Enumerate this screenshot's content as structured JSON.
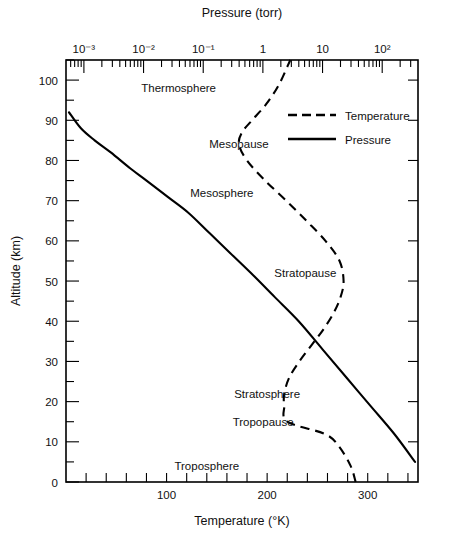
{
  "chart_data": {
    "type": "line",
    "title": "",
    "xlabel": "Temperature (°K)",
    "ylabel": "Altitude (km)",
    "top_axis_label": "Pressure (torr)",
    "grid": false,
    "legend_position": "upper-right",
    "xlim": [
      0,
      350
    ],
    "ylim": [
      0,
      105
    ],
    "top_xlim_log": [
      -3.3,
      2.6
    ],
    "x_ticks": [
      0,
      20,
      40,
      60,
      80,
      100,
      120,
      140,
      160,
      180,
      200,
      220,
      240,
      260,
      280,
      300,
      320,
      340
    ],
    "x_tick_labels": [
      "100",
      "200",
      "300"
    ],
    "x_tick_label_values": [
      100,
      200,
      300
    ],
    "y_ticks": [
      0,
      5,
      10,
      15,
      20,
      25,
      30,
      35,
      40,
      45,
      50,
      55,
      60,
      65,
      70,
      75,
      80,
      85,
      90,
      95,
      100,
      105
    ],
    "y_tick_labels": [
      "0",
      "10",
      "20",
      "30",
      "40",
      "50",
      "60",
      "70",
      "80",
      "90",
      "100"
    ],
    "y_tick_label_values": [
      0,
      10,
      20,
      30,
      40,
      50,
      60,
      70,
      80,
      90,
      100
    ],
    "top_tick_labels": [
      "10⁻³",
      "10⁻²",
      "10⁻¹",
      "1",
      "10",
      "10²"
    ],
    "top_tick_exponents": [
      -3,
      -2,
      -1,
      0,
      1,
      2
    ],
    "series": [
      {
        "name": "Temperature",
        "style": "dashed",
        "axis": "bottom",
        "units": "°K",
        "points": [
          {
            "temperature": 288,
            "altitude": 0
          },
          {
            "temperature": 283,
            "altitude": 4
          },
          {
            "temperature": 271,
            "altitude": 9
          },
          {
            "temperature": 257,
            "altitude": 12
          },
          {
            "temperature": 220,
            "altitude": 15
          },
          {
            "temperature": 217,
            "altitude": 19
          },
          {
            "temperature": 217,
            "altitude": 22
          },
          {
            "temperature": 222,
            "altitude": 26
          },
          {
            "temperature": 232,
            "altitude": 30
          },
          {
            "temperature": 244,
            "altitude": 34
          },
          {
            "temperature": 256,
            "altitude": 38
          },
          {
            "temperature": 266,
            "altitude": 42
          },
          {
            "temperature": 273,
            "altitude": 46
          },
          {
            "temperature": 276,
            "altitude": 50
          },
          {
            "temperature": 272,
            "altitude": 55
          },
          {
            "temperature": 258,
            "altitude": 60
          },
          {
            "temperature": 239,
            "altitude": 65
          },
          {
            "temperature": 219,
            "altitude": 70
          },
          {
            "temperature": 198,
            "altitude": 75
          },
          {
            "temperature": 180,
            "altitude": 80
          },
          {
            "temperature": 172,
            "altitude": 84
          },
          {
            "temperature": 175,
            "altitude": 87
          },
          {
            "temperature": 185,
            "altitude": 90
          },
          {
            "temperature": 199,
            "altitude": 94
          },
          {
            "temperature": 212,
            "altitude": 99
          },
          {
            "temperature": 223,
            "altitude": 105
          }
        ]
      },
      {
        "name": "Pressure",
        "style": "solid",
        "axis": "top",
        "units": "torr",
        "points": [
          {
            "pressure_log10": -3.25,
            "altitude": 92
          },
          {
            "pressure_log10": -3.05,
            "altitude": 88
          },
          {
            "pressure_log10": -2.82,
            "altitude": 85
          },
          {
            "pressure_log10": -2.55,
            "altitude": 82
          },
          {
            "pressure_log10": -2.22,
            "altitude": 78
          },
          {
            "pressure_log10": -1.95,
            "altitude": 75
          },
          {
            "pressure_log10": -1.6,
            "altitude": 71
          },
          {
            "pressure_log10": -1.25,
            "altitude": 67
          },
          {
            "pressure_log10": -0.9,
            "altitude": 62
          },
          {
            "pressure_log10": -0.55,
            "altitude": 57
          },
          {
            "pressure_log10": -0.2,
            "altitude": 52
          },
          {
            "pressure_log10": 0.2,
            "altitude": 46
          },
          {
            "pressure_log10": 0.6,
            "altitude": 40
          },
          {
            "pressure_log10": 1.0,
            "altitude": 33
          },
          {
            "pressure_log10": 1.4,
            "altitude": 26
          },
          {
            "pressure_log10": 1.8,
            "altitude": 19
          },
          {
            "pressure_log10": 2.2,
            "altitude": 12
          },
          {
            "pressure_log10": 2.55,
            "altitude": 5
          }
        ]
      }
    ],
    "annotations": [
      {
        "text": "Thermosphere",
        "temperature": 112,
        "altitude": 98
      },
      {
        "text": "Mesopause",
        "temperature": 172,
        "altitude": 84
      },
      {
        "text": "Mesosphere",
        "temperature": 155,
        "altitude": 72
      },
      {
        "text": "Stratopause",
        "temperature": 238,
        "altitude": 52
      },
      {
        "text": "Stratosphere",
        "temperature": 200,
        "altitude": 22
      },
      {
        "text": "Tropopause",
        "temperature": 196,
        "altitude": 15
      },
      {
        "text": "Troposphere",
        "temperature": 140,
        "altitude": 4
      }
    ],
    "legend": [
      {
        "label": "Temperature",
        "style": "dashed"
      },
      {
        "label": "Pressure",
        "style": "solid"
      }
    ]
  }
}
